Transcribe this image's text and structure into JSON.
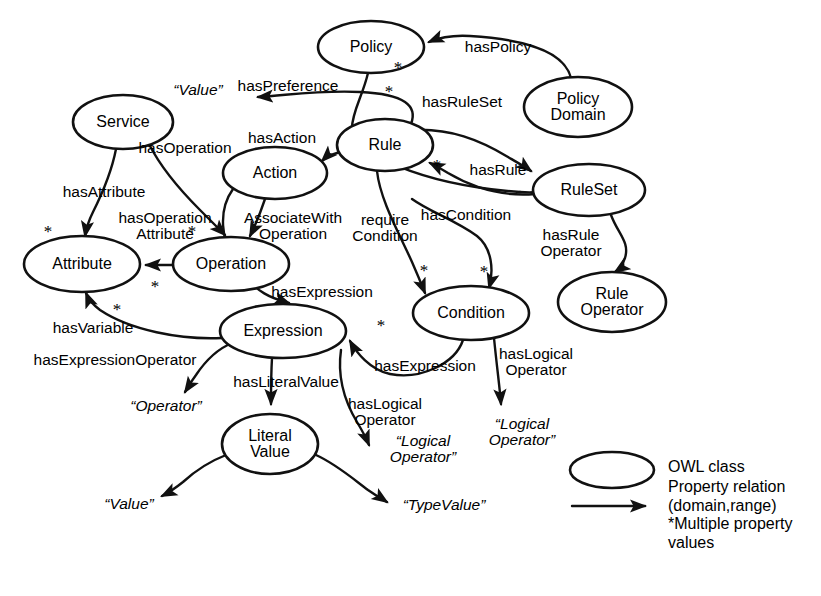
{
  "diagram": {
    "type": "node-link-graph",
    "background_color": "#ffffff",
    "stroke_color": "#111111"
  },
  "nodes": [
    {
      "id": "policy",
      "label": "Policy",
      "cx": 371,
      "cy": 47,
      "rx": 53,
      "ry": 26
    },
    {
      "id": "policy_domain",
      "label": "Policy\nDomain",
      "cx": 578,
      "cy": 107,
      "rx": 54,
      "ry": 30
    },
    {
      "id": "service",
      "label": "Service",
      "cx": 123,
      "cy": 122,
      "rx": 50,
      "ry": 27
    },
    {
      "id": "rule",
      "label": "Rule",
      "cx": 385,
      "cy": 145,
      "rx": 48,
      "ry": 26
    },
    {
      "id": "action",
      "label": "Action",
      "cx": 275,
      "cy": 173,
      "rx": 52,
      "ry": 26
    },
    {
      "id": "ruleset",
      "label": "RuleSet",
      "cx": 589,
      "cy": 190,
      "rx": 56,
      "ry": 26
    },
    {
      "id": "attribute",
      "label": "Attribute",
      "cx": 82,
      "cy": 264,
      "rx": 58,
      "ry": 28
    },
    {
      "id": "operation",
      "label": "Operation",
      "cx": 231,
      "cy": 264,
      "rx": 58,
      "ry": 27
    },
    {
      "id": "condition",
      "label": "Condition",
      "cx": 471,
      "cy": 313,
      "rx": 58,
      "ry": 27
    },
    {
      "id": "rule_operator",
      "label": "Rule\nOperator",
      "cx": 612,
      "cy": 302,
      "rx": 54,
      "ry": 30
    },
    {
      "id": "expression",
      "label": "Expression",
      "cx": 283,
      "cy": 331,
      "rx": 63,
      "ry": 27
    },
    {
      "id": "literal_value",
      "label": "Literal\nValue",
      "cx": 270,
      "cy": 444,
      "rx": 48,
      "ry": 30
    }
  ],
  "edge_labels": [
    {
      "id": "haspolicy",
      "text": "hasPolicy",
      "x": 498,
      "y": 47,
      "align": "center"
    },
    {
      "id": "hasruleset",
      "text": "hasRuleSet",
      "x": 462,
      "y": 102,
      "align": "center"
    },
    {
      "id": "haspreference",
      "text": "hasPreference",
      "x": 288,
      "y": 86,
      "align": "center"
    },
    {
      "id": "hasaction",
      "text": "hasAction",
      "x": 282,
      "y": 138,
      "align": "center"
    },
    {
      "id": "hasrule",
      "text": "hasRule",
      "x": 498,
      "y": 170,
      "align": "center"
    },
    {
      "id": "hasoperation",
      "text": "hasOperation",
      "x": 185,
      "y": 148,
      "align": "center"
    },
    {
      "id": "hasattribute",
      "text": "hasAttribute",
      "x": 104,
      "y": 192,
      "align": "center"
    },
    {
      "id": "hasoperationattribute",
      "text": "hasOperation\nAttribute",
      "x": 165,
      "y": 226,
      "align": "center"
    },
    {
      "id": "associatewithoperation",
      "text": "AssociateWith\nOperation",
      "x": 293,
      "y": 226,
      "align": "center"
    },
    {
      "id": "requirecondition",
      "text": "require\nCondition",
      "x": 385,
      "y": 228,
      "align": "center"
    },
    {
      "id": "hascondition",
      "text": "hasCondition",
      "x": 466,
      "y": 215,
      "align": "center"
    },
    {
      "id": "hasruleoperator",
      "text": "hasRule\nOperator",
      "x": 571,
      "y": 243,
      "align": "center"
    },
    {
      "id": "hasexpression_op",
      "text": "hasExpression",
      "x": 322,
      "y": 292,
      "align": "center"
    },
    {
      "id": "hasvariable",
      "text": "hasVariable",
      "x": 93,
      "y": 328,
      "align": "center"
    },
    {
      "id": "hasexpressionoperator",
      "text": "hasExpressionOperator",
      "x": 115,
      "y": 360,
      "align": "center"
    },
    {
      "id": "hasliteralvalue",
      "text": "hasLiteralValue",
      "x": 286,
      "y": 382,
      "align": "center"
    },
    {
      "id": "hasexpression_cond",
      "text": "hasExpression",
      "x": 425,
      "y": 366,
      "align": "center"
    },
    {
      "id": "haslogicaloperator_e",
      "text": "hasLogical\nOperator",
      "x": 385,
      "y": 412,
      "align": "center"
    },
    {
      "id": "haslogicaloperator_c",
      "text": "hasLogical\nOperator",
      "x": 536,
      "y": 362,
      "align": "center"
    }
  ],
  "range_labels": [
    {
      "id": "value_pref",
      "text": "“Value”",
      "x": 198,
      "y": 90
    },
    {
      "id": "operator_expr",
      "text": "“Operator”",
      "x": 166,
      "y": 406
    },
    {
      "id": "logical_operator1",
      "text": "“Logical\nOperator”",
      "x": 423,
      "y": 449
    },
    {
      "id": "logical_operator2",
      "text": "“Logical\nOperator”",
      "x": 522,
      "y": 432
    },
    {
      "id": "value_literal",
      "text": "“Value”",
      "x": 129,
      "y": 504
    },
    {
      "id": "typevalue",
      "text": "“TypeValue”",
      "x": 444,
      "y": 505
    }
  ],
  "stars": [
    {
      "id": "star-policy-haspolicy",
      "x": 398,
      "y": 68
    },
    {
      "id": "star-policy-hasruleset",
      "x": 389,
      "y": 92
    },
    {
      "id": "star-rule-hasrule",
      "x": 437,
      "y": 166
    },
    {
      "id": "star-attribute-in",
      "x": 48,
      "y": 232
    },
    {
      "id": "star-operation-attr",
      "x": 192,
      "y": 232
    },
    {
      "id": "star-operation-out",
      "x": 155,
      "y": 287
    },
    {
      "id": "star-attribute-var",
      "x": 117,
      "y": 310
    },
    {
      "id": "star-condition-left",
      "x": 424,
      "y": 271
    },
    {
      "id": "star-condition-right",
      "x": 484,
      "y": 272
    },
    {
      "id": "star-expression-right",
      "x": 381,
      "y": 326
    }
  ],
  "legend": {
    "owl_class_label": "OWL class",
    "property_relation_label": "Property relation\n(domain,range)\n*Multiple property\nvalues",
    "ellipse": {
      "cx": 612,
      "cy": 470,
      "rx": 42,
      "ry": 18
    },
    "arrow": {
      "x1": 572,
      "y1": 506,
      "x2": 652,
      "y2": 506
    },
    "text_x": 668,
    "text_y": 458
  }
}
